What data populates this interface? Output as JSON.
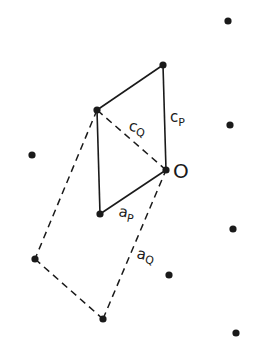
{
  "diagram": {
    "type": "lattice-vector-diagram",
    "labels": {
      "origin": "O",
      "c_p": "c",
      "c_p_sub": "P",
      "c_q": "c",
      "c_q_sub": "Q",
      "a_p": "a",
      "a_p_sub": "P",
      "a_q": "a",
      "a_q_sub": "Q"
    },
    "points": [
      {
        "x": 228,
        "y": 21
      },
      {
        "x": 163,
        "y": 65
      },
      {
        "x": 97,
        "y": 110
      },
      {
        "x": 230,
        "y": 125
      },
      {
        "x": 32,
        "y": 155
      },
      {
        "x": 166,
        "y": 170
      },
      {
        "x": 100,
        "y": 214
      },
      {
        "x": 233,
        "y": 229
      },
      {
        "x": 35,
        "y": 259
      },
      {
        "x": 169,
        "y": 275
      },
      {
        "x": 103,
        "y": 319
      },
      {
        "x": 236,
        "y": 333
      }
    ],
    "colors": {
      "ink": "#1a1a1a",
      "background": "#ffffff"
    }
  }
}
